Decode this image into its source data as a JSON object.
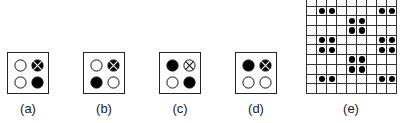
{
  "figure": {
    "panels": [
      {
        "label": "(a)",
        "cells": [
          "empty",
          "crossed-filled",
          "empty",
          "filled"
        ]
      },
      {
        "label": "(b)",
        "cells": [
          "empty",
          "crossed-filled",
          "filled",
          "empty"
        ]
      },
      {
        "label": "(c)",
        "cells": [
          "filled",
          "crossed-empty",
          "empty",
          "filled"
        ]
      },
      {
        "label": "(d)",
        "cells": [
          "filled",
          "crossed-filled",
          "empty",
          "empty"
        ]
      }
    ],
    "grid_panel": {
      "label": "(e)",
      "rows": 10,
      "cols": 9,
      "dots": [
        [
          1,
          1
        ],
        [
          1,
          2
        ],
        [
          1,
          7
        ],
        [
          1,
          8
        ],
        [
          2,
          4
        ],
        [
          2,
          5
        ],
        [
          3,
          4
        ],
        [
          3,
          5
        ],
        [
          4,
          1
        ],
        [
          4,
          2
        ],
        [
          4,
          7
        ],
        [
          4,
          8
        ],
        [
          5,
          1
        ],
        [
          5,
          2
        ],
        [
          5,
          7
        ],
        [
          5,
          8
        ],
        [
          6,
          4
        ],
        [
          6,
          5
        ],
        [
          7,
          4
        ],
        [
          7,
          5
        ],
        [
          8,
          1
        ],
        [
          8,
          2
        ],
        [
          8,
          7
        ],
        [
          8,
          8
        ]
      ]
    },
    "colors": {
      "stroke": "#222222",
      "fill": "#000000",
      "background": "#ffffff"
    }
  }
}
